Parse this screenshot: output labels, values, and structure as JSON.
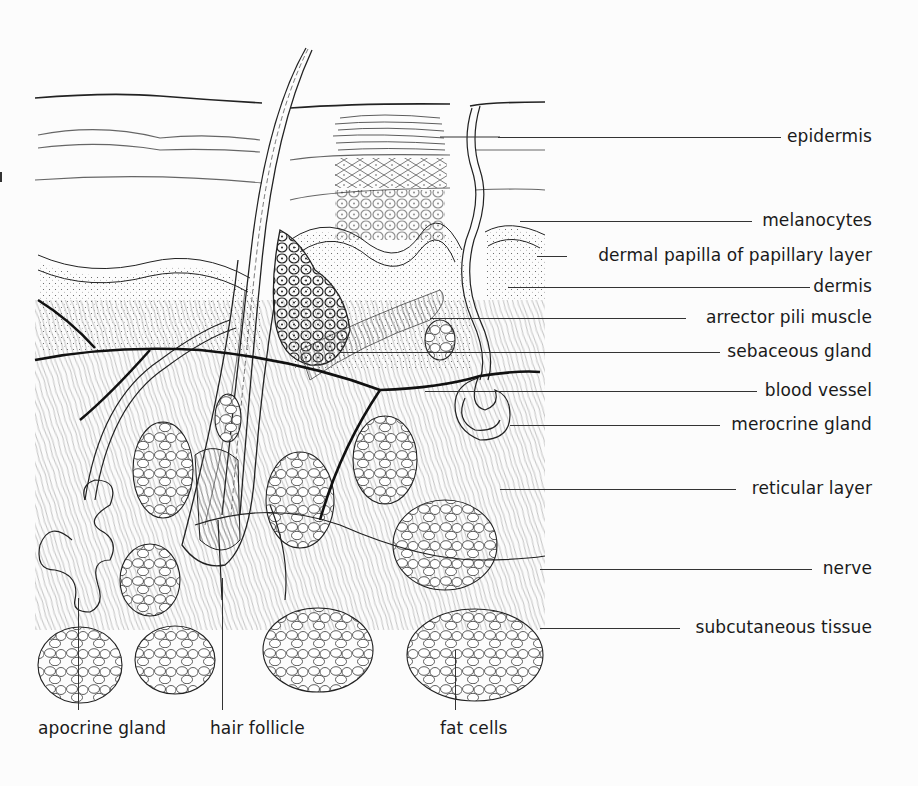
{
  "diagram": {
    "right_labels": [
      {
        "id": "epidermis",
        "text": "epidermis",
        "y": 137,
        "line_from_x": 498,
        "right_x": 872
      },
      {
        "id": "melanocytes",
        "text": "melanocytes",
        "y": 221,
        "line_from_x": 520,
        "right_x": 872
      },
      {
        "id": "dermal-papilla",
        "text": "dermal papilla of papillary layer",
        "y": 256,
        "line_from_x": 537,
        "right_x": 872
      },
      {
        "id": "dermis",
        "text": "dermis",
        "y": 287,
        "line_from_x": 508,
        "right_x": 872
      },
      {
        "id": "arrector-pili-muscle",
        "text": "arrector pili muscle",
        "y": 318,
        "line_from_x": 430,
        "right_x": 872
      },
      {
        "id": "sebaceous-gland",
        "text": "sebaceous gland",
        "y": 352,
        "line_from_x": 340,
        "right_x": 872
      },
      {
        "id": "blood-vessel",
        "text": "blood vessel",
        "y": 391,
        "line_from_x": 425,
        "right_x": 872
      },
      {
        "id": "merocrine-gland",
        "text": "merocrine gland",
        "y": 425,
        "line_from_x": 510,
        "right_x": 872
      },
      {
        "id": "reticular-layer",
        "text": "reticular layer",
        "y": 489,
        "line_from_x": 500,
        "right_x": 872
      },
      {
        "id": "nerve",
        "text": "nerve",
        "y": 569,
        "line_from_x": 540,
        "right_x": 872
      },
      {
        "id": "subcutaneous-tissue",
        "text": "subcutaneous tissue",
        "y": 628,
        "line_from_x": 540,
        "right_x": 872
      }
    ],
    "bottom_labels": [
      {
        "id": "apocrine-gland",
        "text": "apocrine gland",
        "x": 38,
        "line_x": 78,
        "line_top": 598
      },
      {
        "id": "hair-follicle",
        "text": "hair follicle",
        "x": 210,
        "line_x": 222,
        "line_top": 578
      },
      {
        "id": "fat-cells",
        "text": "fat cells",
        "x": 440,
        "line_x": 455,
        "line_top": 650
      }
    ],
    "bottom_label_y": 718,
    "colors": {
      "ink": "#1a1a1a",
      "background": "#fcfcfc"
    }
  }
}
